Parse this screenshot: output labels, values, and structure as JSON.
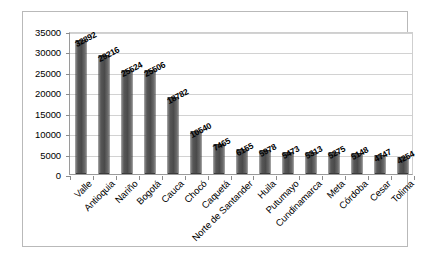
{
  "chart_data": {
    "type": "bar",
    "title": "",
    "subtitle": "",
    "xlabel": "",
    "ylabel": "",
    "ylim": [
      0,
      35000
    ],
    "ytick_step": 5000,
    "yticks": [
      "0",
      "5000",
      "10000",
      "15000",
      "20000",
      "25000",
      "30000",
      "35000"
    ],
    "grid": true,
    "legend": false,
    "legend_position": "none",
    "categories": [
      "Valle",
      "Antioquia",
      "Nariño",
      "Bogotá",
      "Cauca",
      "Chocó",
      "Caquetá",
      "Norte de Santander",
      "Huila",
      "Putumayo",
      "Cundinamarca",
      "Meta",
      "Córdoba",
      "Cesar",
      "Tolima"
    ],
    "values": [
      32892,
      29216,
      25524,
      25506,
      18782,
      10540,
      7465,
      6155,
      5978,
      5473,
      5313,
      5275,
      5148,
      4747,
      4254
    ],
    "value_labels": [
      "32892",
      "29216",
      "25524",
      "25506",
      "18782",
      "10540",
      "7465",
      "6155",
      "5978",
      "5473",
      "5313",
      "5275",
      "5148",
      "4747",
      "4254"
    ],
    "bar_color": "#4a4a4a",
    "bar_border_color": "#3b3b3b",
    "gridline_color": "#d2d2d2",
    "axis_color": "#9a9a9a",
    "plot_background": "#ffffff",
    "frame_color": "#b9b9b9"
  }
}
